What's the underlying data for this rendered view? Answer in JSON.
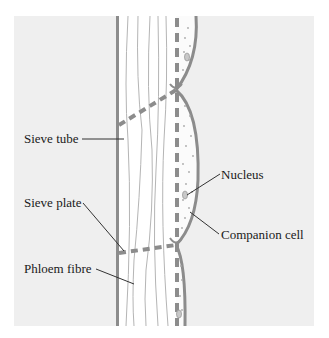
{
  "diagram": {
    "labels": {
      "sieve_tube": "Sieve tube",
      "sieve_plate": "Sieve plate",
      "phloem_fibre": "Phloem fibre",
      "nucleus": "Nucleus",
      "companion_cell": "Companion cell"
    },
    "colors": {
      "background_panel": "#efefef",
      "cell_wall": "#8c8c8c",
      "cell_interior": "#ffffff",
      "fibre_lines": "#b5b5b5",
      "leader_lines": "#333333",
      "text": "#1a1a1a"
    }
  }
}
